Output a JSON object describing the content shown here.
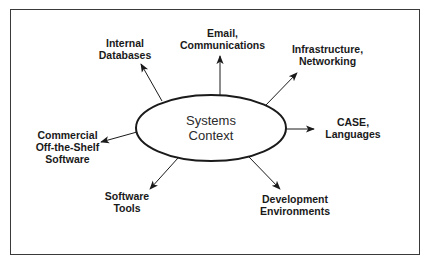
{
  "diagram": {
    "center": {
      "label": "Systems\nContext"
    },
    "nodes": [
      {
        "id": "internal-databases",
        "label": "Internal\nDatabases"
      },
      {
        "id": "email-communications",
        "label": "Email,\nCommunications"
      },
      {
        "id": "infrastructure-networking",
        "label": "Infrastructure,\nNetworking"
      },
      {
        "id": "case-languages",
        "label": "CASE,\nLanguages"
      },
      {
        "id": "development-environments",
        "label": "Development\nEnvironments"
      },
      {
        "id": "software-tools",
        "label": "Software\nTools"
      },
      {
        "id": "cots-software",
        "label": "Commercial\nOff-the-Shelf\nSoftware"
      }
    ],
    "edges": [
      {
        "from": "center",
        "to": "internal-databases"
      },
      {
        "from": "center",
        "to": "email-communications"
      },
      {
        "from": "center",
        "to": "infrastructure-networking"
      },
      {
        "from": "center",
        "to": "case-languages"
      },
      {
        "from": "center",
        "to": "development-environments"
      },
      {
        "from": "center",
        "to": "software-tools"
      },
      {
        "from": "center",
        "to": "cots-software"
      }
    ]
  }
}
